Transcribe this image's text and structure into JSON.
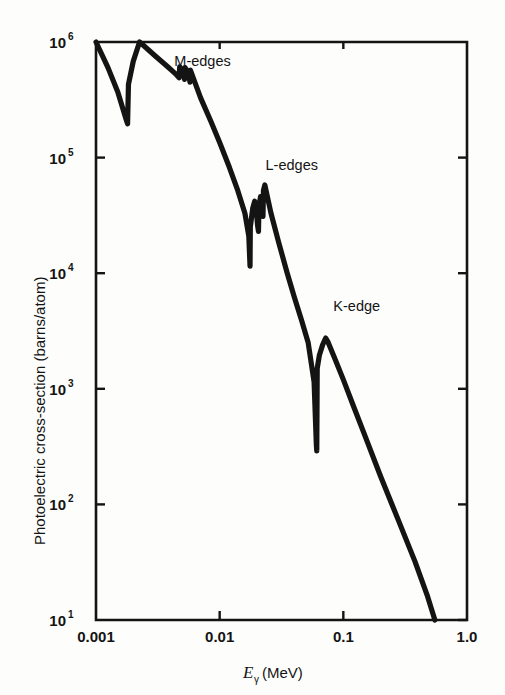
{
  "chart_data": {
    "type": "line",
    "title": "",
    "xlabel": "Eγ (MeV)",
    "xlabel_symbol": "E",
    "xlabel_subscript": "γ",
    "xlabel_units": "(MeV)",
    "ylabel": "Photoelectric cross-section (barns/atom)",
    "xscale": "log",
    "yscale": "log",
    "xlim": [
      0.001,
      1.0
    ],
    "ylim": [
      10,
      1000000
    ],
    "grid": false,
    "legend": null,
    "x_tick_labels": [
      "0.001",
      "0.01",
      "0.1",
      "1.0"
    ],
    "x_tick_values": [
      0.001,
      0.01,
      0.1,
      1.0
    ],
    "y_tick_labels": [
      "10¹",
      "10²",
      "10³",
      "10⁴",
      "10⁵",
      "10⁶"
    ],
    "y_tick_mantissa": "10",
    "y_tick_exponents": [
      "1",
      "2",
      "3",
      "4",
      "5",
      "6"
    ],
    "y_tick_values": [
      10,
      100,
      1000,
      10000,
      100000,
      1000000
    ],
    "annotations": [
      {
        "text": "M-edges",
        "x": 0.0043,
        "y": 620000
      },
      {
        "text": "L-edges",
        "x": 0.0235,
        "y": 78000
      },
      {
        "text": "K-edge",
        "x": 0.083,
        "y": 4700
      }
    ],
    "series": [
      {
        "name": "Photoelectric cross-section",
        "color": "#141414",
        "points": [
          [
            0.001,
            1000000
          ],
          [
            0.00125,
            600000
          ],
          [
            0.0015,
            370000
          ],
          [
            0.00175,
            215000
          ],
          [
            0.0018,
            196000
          ],
          [
            0.00183,
            430000
          ],
          [
            0.002,
            680000
          ],
          [
            0.00225,
            1000000
          ],
          [
            0.00235,
            960000
          ],
          [
            0.003,
            760000
          ],
          [
            0.0038,
            610000
          ],
          [
            0.0044,
            530000
          ],
          [
            0.0047,
            490000
          ],
          [
            0.00475,
            610000
          ],
          [
            0.0051,
            560000
          ],
          [
            0.0052,
            475000
          ],
          [
            0.00525,
            600000
          ],
          [
            0.0056,
            540000
          ],
          [
            0.00575,
            450000
          ],
          [
            0.0058,
            570000
          ],
          [
            0.0062,
            470000
          ],
          [
            0.007,
            330000
          ],
          [
            0.0085,
            205000
          ],
          [
            0.01,
            135000
          ],
          [
            0.012,
            82000
          ],
          [
            0.014,
            52000
          ],
          [
            0.016,
            33000
          ],
          [
            0.0172,
            21000
          ],
          [
            0.0176,
            11500
          ],
          [
            0.0177,
            25000
          ],
          [
            0.0185,
            36500
          ],
          [
            0.0192,
            42000
          ],
          [
            0.0198,
            34000
          ],
          [
            0.0203,
            25500
          ],
          [
            0.0206,
            23000
          ],
          [
            0.0208,
            38000
          ],
          [
            0.0214,
            46000
          ],
          [
            0.0218,
            41000
          ],
          [
            0.0221,
            33000
          ],
          [
            0.0224,
            31000
          ],
          [
            0.0226,
            52000
          ],
          [
            0.0232,
            58000
          ],
          [
            0.0242,
            47000
          ],
          [
            0.026,
            33000
          ],
          [
            0.03,
            18500
          ],
          [
            0.035,
            10200
          ],
          [
            0.04,
            6300
          ],
          [
            0.046,
            3900
          ],
          [
            0.052,
            2500
          ],
          [
            0.058,
            1150
          ],
          [
            0.0605,
            330
          ],
          [
            0.061,
            290
          ],
          [
            0.0615,
            1500
          ],
          [
            0.064,
            1950
          ],
          [
            0.068,
            2400
          ],
          [
            0.072,
            2750
          ],
          [
            0.075,
            2550
          ],
          [
            0.085,
            1850
          ],
          [
            0.1,
            1200
          ],
          [
            0.12,
            720
          ],
          [
            0.15,
            390
          ],
          [
            0.2,
            175
          ],
          [
            0.28,
            72
          ],
          [
            0.38,
            32
          ],
          [
            0.48,
            16
          ],
          [
            0.55,
            10
          ]
        ]
      }
    ]
  },
  "plot_geometry": {
    "left": 96,
    "right": 467,
    "top": 42,
    "bottom": 620
  }
}
